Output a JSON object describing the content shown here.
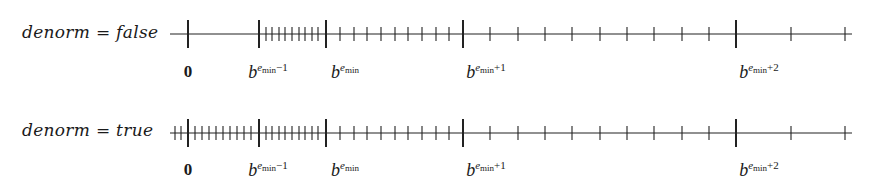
{
  "figure": {
    "rows": [
      {
        "label": "denorm = false",
        "label_x": 22,
        "label_y": 22,
        "line_y": 34,
        "line_start_x": 170,
        "line_end_x": 852,
        "major_ticks_x": [
          188,
          259,
          326,
          463,
          736
        ],
        "minor_ticks_x": [
          266,
          272,
          279,
          285,
          292,
          299,
          305,
          312,
          318,
          340,
          354,
          367,
          381,
          395,
          408,
          422,
          436,
          449,
          490,
          518,
          545,
          572,
          600,
          627,
          654,
          682,
          709,
          791,
          845
        ],
        "tick_labels_y": 62
      },
      {
        "label": "denorm = true",
        "label_x": 22,
        "label_y": 120,
        "line_y": 133,
        "line_start_x": 170,
        "line_end_x": 852,
        "major_ticks_x": [
          188,
          259,
          326,
          463,
          736
        ],
        "minor_ticks_x": [
          175,
          181,
          195,
          202,
          209,
          216,
          223,
          230,
          237,
          244,
          251,
          266,
          272,
          279,
          285,
          292,
          299,
          305,
          312,
          318,
          340,
          354,
          367,
          381,
          395,
          408,
          422,
          436,
          449,
          490,
          518,
          545,
          572,
          600,
          627,
          654,
          682,
          709,
          791,
          845
        ],
        "tick_labels_y": 160
      }
    ],
    "tick_labels": [
      {
        "x": 188,
        "text": "0",
        "kind": "zero"
      },
      {
        "x": 268,
        "base": "b",
        "exp_var": "e",
        "exp_sub": "min",
        "exp_suffix": "−1"
      },
      {
        "x": 345,
        "base": "b",
        "exp_var": "e",
        "exp_sub": "min",
        "exp_suffix": ""
      },
      {
        "x": 486,
        "base": "b",
        "exp_var": "e",
        "exp_sub": "min",
        "exp_suffix": "+1"
      },
      {
        "x": 759,
        "base": "b",
        "exp_var": "e",
        "exp_sub": "min",
        "exp_suffix": "+2"
      }
    ],
    "style": {
      "major_tick_half_height": 14,
      "minor_tick_half_height": 7,
      "line_color": "#222222",
      "text_color": "#1a1a1a"
    }
  }
}
